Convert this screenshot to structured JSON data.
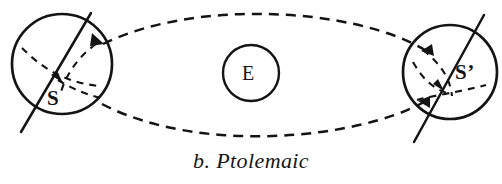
{
  "figure": {
    "caption": "b. Ptolemaic",
    "caption_label": "b.",
    "caption_title": "Ptolemaic",
    "background_color": "#ffffff",
    "ink_color": "#141414"
  },
  "labels": {
    "sun_left": "S",
    "sun_right": "S’",
    "earth": "E"
  },
  "diagram": {
    "type": "astronomical-schematic",
    "bodies": [
      {
        "name": "sun-left",
        "label": "S",
        "shape": "circle",
        "cx": 62,
        "cy": 64,
        "r": 50,
        "stroke": "#141414",
        "stroke_width": 2.6,
        "fill": "none"
      },
      {
        "name": "earth",
        "label": "E",
        "shape": "circle",
        "cx": 251,
        "cy": 73,
        "r": 28,
        "stroke": "#141414",
        "stroke_width": 2.4,
        "fill": "none"
      },
      {
        "name": "sun-right",
        "label": "S’",
        "shape": "circle",
        "cx": 450,
        "cy": 72,
        "r": 47,
        "stroke": "#141414",
        "stroke_width": 2.6,
        "fill": "none"
      }
    ],
    "axes": [
      {
        "name": "sun-left-axis",
        "x1": 22,
        "y1": 131,
        "x2": 90,
        "y2": 14,
        "stroke": "#141414",
        "stroke_width": 2.4
      },
      {
        "name": "sun-right-axis",
        "x1": 415,
        "y1": 140,
        "x2": 482,
        "y2": 16,
        "stroke": "#141414",
        "stroke_width": 2.4
      }
    ],
    "orbit": {
      "name": "deferent-ellipse",
      "style": "dashed",
      "dash": "9 7",
      "stroke": "#141414",
      "stroke_width": 2.4,
      "upper_arc": "M 101 43 C 170 17, 340 17, 424 49",
      "lower_arc": "M 101 103 C 175 135, 345 133, 424 101"
    },
    "equator_arcs": [
      {
        "name": "sun-left-equator",
        "style": "dashed",
        "dash": "7 6",
        "stroke": "#141414",
        "stroke_width": 2.2
      },
      {
        "name": "sun-right-equator",
        "style": "dashed",
        "dash": "7 6",
        "stroke": "#141414",
        "stroke_width": 2.2
      }
    ],
    "arrowheads": [
      {
        "name": "sun-left-arrow",
        "at": [
          60,
          82
        ]
      },
      {
        "name": "sun-left-orbit-arrow",
        "at": [
          101,
          43
        ]
      },
      {
        "name": "sun-right-orbit-arrow-upper",
        "at": [
          424,
          49
        ]
      },
      {
        "name": "sun-right-orbit-arrow-lower",
        "at": [
          424,
          101
        ]
      },
      {
        "name": "sun-right-arrow",
        "at": [
          443,
          88
        ]
      }
    ]
  }
}
